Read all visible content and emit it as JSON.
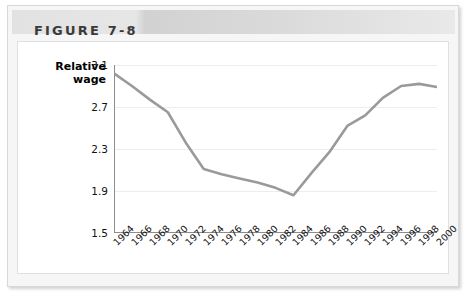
{
  "figure": {
    "label": "FIGURE 7-8"
  },
  "chart_data": {
    "type": "line",
    "title": "FIGURE 7-8",
    "xlabel": "",
    "ylabel": "Relative wage",
    "ylabel_lines": [
      "Relative",
      "wage"
    ],
    "ylim": [
      1.5,
      3.1
    ],
    "yticks": [
      "1.5",
      "1.9",
      "2.3",
      "2.7",
      "3.1"
    ],
    "ytick_values": [
      1.5,
      1.9,
      2.3,
      2.7,
      3.1
    ],
    "xlim": [
      1964,
      2000
    ],
    "grid": true,
    "grid_axis": "y",
    "legend": "none",
    "line_color": "#9a9a9a",
    "categories": [
      "1964",
      "1966",
      "1968",
      "1970",
      "1972",
      "1974",
      "1976",
      "1978",
      "1980",
      "1982",
      "1984",
      "1986",
      "1988",
      "1990",
      "1992",
      "1994",
      "1996",
      "1998",
      "2000"
    ],
    "x": [
      1964,
      1966,
      1968,
      1970,
      1972,
      1974,
      1976,
      1978,
      1980,
      1982,
      1984,
      1986,
      1988,
      1990,
      1992,
      1994,
      1996,
      1998,
      2000
    ],
    "values": [
      3.02,
      2.9,
      2.77,
      2.65,
      2.36,
      2.11,
      2.06,
      2.02,
      1.98,
      1.93,
      1.86,
      2.07,
      2.27,
      2.52,
      2.62,
      2.79,
      2.9,
      2.92,
      2.89
    ]
  }
}
